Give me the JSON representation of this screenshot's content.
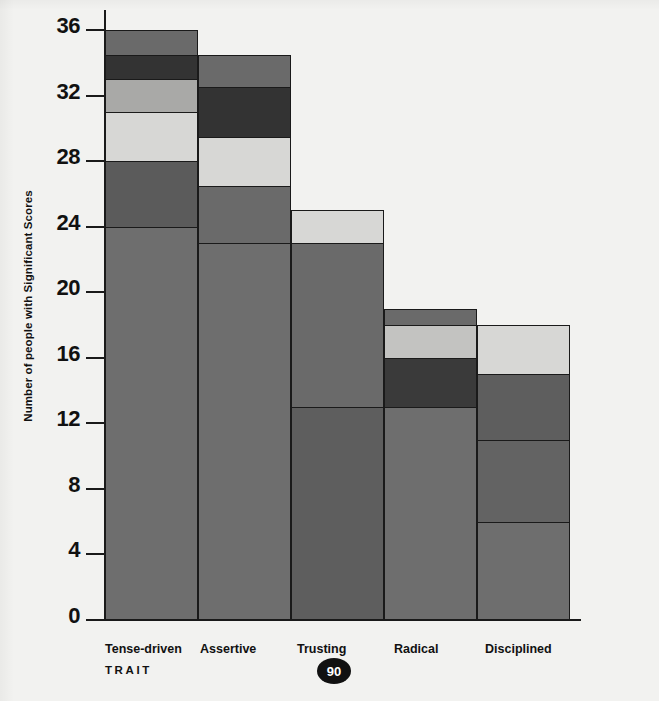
{
  "chart_data": {
    "type": "bar",
    "subtype": "stacked-bar",
    "title": "",
    "xlabel": "TRAIT",
    "ylabel": "Number of people with Significant Scores",
    "categories": [
      "Tense-driven",
      "Assertive",
      "Trusting",
      "Radical",
      "Disciplined"
    ],
    "ylim": [
      0,
      36
    ],
    "ytick_labels": [
      "36",
      "32",
      "28",
      "24",
      "20",
      "16",
      "12",
      "8",
      "4",
      "0"
    ],
    "yticks": [
      36,
      32,
      28,
      24,
      20,
      16,
      12,
      8,
      4,
      0
    ],
    "ytick_step": 4,
    "grid": false,
    "legend": "none",
    "totals": [
      36,
      34.5,
      25,
      19,
      18
    ],
    "stacks": [
      {
        "category": "Tense-driven",
        "total": 36,
        "boundaries": [
          0,
          24,
          28,
          31,
          33,
          34.5,
          36
        ],
        "segments": [
          {
            "from": 0,
            "to": 24,
            "value": 24,
            "color": "#6e6e6e"
          },
          {
            "from": 24,
            "to": 28,
            "value": 4,
            "color": "#5b5b5b"
          },
          {
            "from": 28,
            "to": 31,
            "value": 3,
            "color": "#d7d7d5"
          },
          {
            "from": 31,
            "to": 33,
            "value": 2,
            "color": "#a9a9a7"
          },
          {
            "from": 33,
            "to": 34.5,
            "value": 1.5,
            "color": "#333333"
          },
          {
            "from": 34.5,
            "to": 36,
            "value": 1.5,
            "color": "#6a6a6a"
          }
        ]
      },
      {
        "category": "Assertive",
        "total": 34.5,
        "boundaries": [
          0,
          23,
          26.5,
          29.5,
          32.5,
          34.5
        ],
        "segments": [
          {
            "from": 0,
            "to": 23,
            "value": 23,
            "color": "#6e6e6e"
          },
          {
            "from": 23,
            "to": 26.5,
            "value": 3.5,
            "color": "#6a6a6a"
          },
          {
            "from": 26.5,
            "to": 29.5,
            "value": 3,
            "color": "#d7d7d5"
          },
          {
            "from": 29.5,
            "to": 32.5,
            "value": 3,
            "color": "#333333"
          },
          {
            "from": 32.5,
            "to": 34.5,
            "value": 2,
            "color": "#6a6a6a"
          }
        ]
      },
      {
        "category": "Trusting",
        "total": 25,
        "boundaries": [
          0,
          13,
          23,
          25
        ],
        "segments": [
          {
            "from": 0,
            "to": 13,
            "value": 13,
            "color": "#5e5e5e"
          },
          {
            "from": 13,
            "to": 23,
            "value": 10,
            "color": "#6a6a6a"
          },
          {
            "from": 23,
            "to": 25,
            "value": 2,
            "color": "#d7d7d5"
          }
        ]
      },
      {
        "category": "Radical",
        "total": 19,
        "boundaries": [
          0,
          13,
          16,
          18,
          19
        ],
        "segments": [
          {
            "from": 0,
            "to": 13,
            "value": 13,
            "color": "#6e6e6e"
          },
          {
            "from": 13,
            "to": 16,
            "value": 3,
            "color": "#3a3a3a"
          },
          {
            "from": 16,
            "to": 18,
            "value": 2,
            "color": "#c3c3c1"
          },
          {
            "from": 18,
            "to": 19,
            "value": 1,
            "color": "#6a6a6a"
          }
        ]
      },
      {
        "category": "Disciplined",
        "total": 18,
        "boundaries": [
          0,
          6,
          11,
          15,
          18
        ],
        "segments": [
          {
            "from": 0,
            "to": 6,
            "value": 6,
            "color": "#6e6e6e"
          },
          {
            "from": 6,
            "to": 11,
            "value": 5,
            "color": "#636363"
          },
          {
            "from": 11,
            "to": 15,
            "value": 4,
            "color": "#5e5e5e"
          },
          {
            "from": 15,
            "to": 18,
            "value": 3,
            "color": "#d7d7d5"
          }
        ]
      }
    ]
  },
  "axis": {
    "y_title": "Number of people with Significant Scores",
    "x_note": "TRAIT"
  },
  "footer": {
    "page_number": "90"
  },
  "colors": {
    "background": "#f2f2f0",
    "axis": "#1a1a1a",
    "text": "#111111",
    "page_badge_bg": "#111111",
    "page_badge_text": "#ffffff"
  }
}
